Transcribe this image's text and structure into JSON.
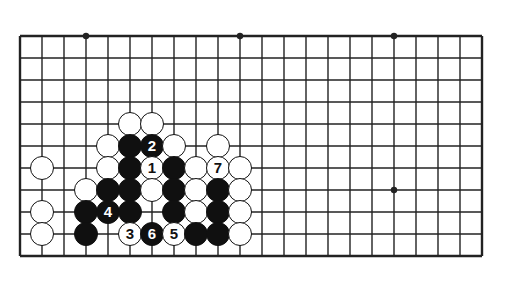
{
  "figure": {
    "board": {
      "grid_origin_x": 20,
      "grid_origin_y": 36,
      "grid_spacing": 22,
      "cols": 22,
      "rows": 11,
      "edge_top": true,
      "edge_left": true,
      "edge_right": true,
      "edge_bottom": true,
      "line_color": "#222222",
      "board_color": "#ffffff",
      "star_points": [
        {
          "col": 3,
          "row": 0
        },
        {
          "col": 10,
          "row": 0
        },
        {
          "col": 17,
          "row": 0
        },
        {
          "col": 17,
          "row": 7
        }
      ]
    },
    "stones": [
      {
        "col": 5,
        "row": 4,
        "color": "white",
        "label": ""
      },
      {
        "col": 6,
        "row": 4,
        "color": "white",
        "label": ""
      },
      {
        "col": 4,
        "row": 5,
        "color": "white",
        "label": ""
      },
      {
        "col": 5,
        "row": 5,
        "color": "black",
        "label": ""
      },
      {
        "col": 6,
        "row": 5,
        "color": "black",
        "label": "2"
      },
      {
        "col": 7,
        "row": 5,
        "color": "white",
        "label": ""
      },
      {
        "col": 9,
        "row": 5,
        "color": "white",
        "label": ""
      },
      {
        "col": 1,
        "row": 6,
        "color": "white",
        "label": ""
      },
      {
        "col": 4,
        "row": 6,
        "color": "white",
        "label": ""
      },
      {
        "col": 5,
        "row": 6,
        "color": "black",
        "label": ""
      },
      {
        "col": 6,
        "row": 6,
        "color": "white",
        "label": "1"
      },
      {
        "col": 7,
        "row": 6,
        "color": "black",
        "label": ""
      },
      {
        "col": 8,
        "row": 6,
        "color": "white",
        "label": ""
      },
      {
        "col": 9,
        "row": 6,
        "color": "white",
        "label": "7"
      },
      {
        "col": 10,
        "row": 6,
        "color": "white",
        "label": ""
      },
      {
        "col": 3,
        "row": 7,
        "color": "white",
        "label": ""
      },
      {
        "col": 4,
        "row": 7,
        "color": "black",
        "label": ""
      },
      {
        "col": 5,
        "row": 7,
        "color": "black",
        "label": ""
      },
      {
        "col": 6,
        "row": 7,
        "color": "white",
        "label": ""
      },
      {
        "col": 7,
        "row": 7,
        "color": "black",
        "label": ""
      },
      {
        "col": 8,
        "row": 7,
        "color": "white",
        "label": ""
      },
      {
        "col": 9,
        "row": 7,
        "color": "black",
        "label": ""
      },
      {
        "col": 10,
        "row": 7,
        "color": "white",
        "label": ""
      },
      {
        "col": 1,
        "row": 8,
        "color": "white",
        "label": ""
      },
      {
        "col": 3,
        "row": 8,
        "color": "black",
        "label": ""
      },
      {
        "col": 4,
        "row": 8,
        "color": "black",
        "label": "4"
      },
      {
        "col": 5,
        "row": 8,
        "color": "black",
        "label": ""
      },
      {
        "col": 7,
        "row": 8,
        "color": "black",
        "label": ""
      },
      {
        "col": 8,
        "row": 8,
        "color": "white",
        "label": ""
      },
      {
        "col": 9,
        "row": 8,
        "color": "black",
        "label": ""
      },
      {
        "col": 10,
        "row": 8,
        "color": "white",
        "label": ""
      },
      {
        "col": 1,
        "row": 9,
        "color": "white",
        "label": ""
      },
      {
        "col": 3,
        "row": 9,
        "color": "black",
        "label": ""
      },
      {
        "col": 5,
        "row": 9,
        "color": "white",
        "label": "3"
      },
      {
        "col": 6,
        "row": 9,
        "color": "black",
        "label": "6"
      },
      {
        "col": 7,
        "row": 9,
        "color": "white",
        "label": "5"
      },
      {
        "col": 8,
        "row": 9,
        "color": "black",
        "label": ""
      },
      {
        "col": 9,
        "row": 9,
        "color": "black",
        "label": ""
      },
      {
        "col": 10,
        "row": 9,
        "color": "white",
        "label": ""
      }
    ]
  }
}
